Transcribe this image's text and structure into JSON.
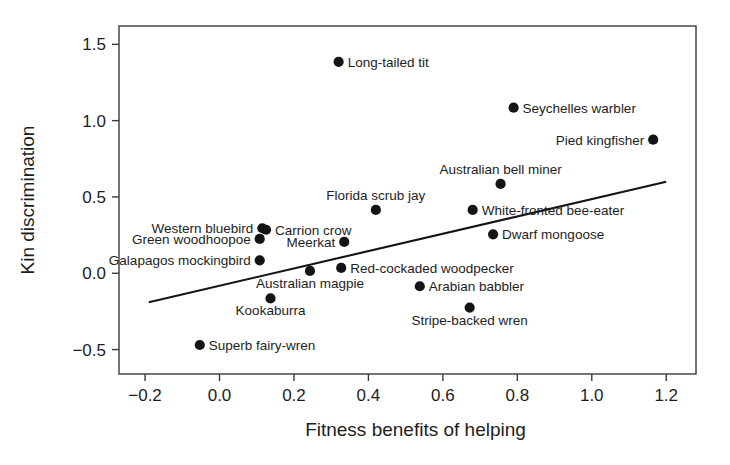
{
  "chart_data": {
    "type": "scatter",
    "title": "",
    "subtitle": "",
    "xlabel": "Fitness benefits of helping",
    "ylabel": "Kin discrimination",
    "xlim": [
      -0.27,
      1.28
    ],
    "ylim": [
      -0.66,
      1.62
    ],
    "xticks": [
      "-0.2",
      "0.0",
      "0.2",
      "0.4",
      "0.6",
      "0.8",
      "1.0",
      "1.2"
    ],
    "xtick_values": [
      -0.2,
      0.0,
      0.2,
      0.4,
      0.6,
      0.8,
      1.0,
      1.2
    ],
    "yticks": [
      "1.5",
      "1.0",
      "0.5",
      "0.0",
      "-0.5"
    ],
    "ytick_values": [
      1.5,
      1.0,
      0.5,
      0.0,
      -0.5
    ],
    "grid": false,
    "legend": false,
    "marker_color": "#141414",
    "line_color": "#141414",
    "axis_color": "#3a3a3a",
    "trendline": {
      "label": "regression-line",
      "x0": -0.19,
      "y0": -0.19,
      "x1": 1.2,
      "y1": 0.6
    },
    "points": [
      {
        "name": "Long-tailed tit",
        "x": 0.32,
        "y": 1.385,
        "label": "Long-tailed tit",
        "label_pos": "right"
      },
      {
        "name": "Seychelles warbler",
        "x": 0.79,
        "y": 1.085,
        "label": "Seychelles warbler",
        "label_pos": "right"
      },
      {
        "name": "Pied kingfisher",
        "x": 1.165,
        "y": 0.875,
        "label": "Pied kingfisher",
        "label_pos": "left"
      },
      {
        "name": "Australian bell miner",
        "x": 0.755,
        "y": 0.585,
        "label": "Australian bell miner",
        "label_pos": "above"
      },
      {
        "name": "Florida scrub jay",
        "x": 0.42,
        "y": 0.415,
        "label": "Florida scrub jay",
        "label_pos": "above"
      },
      {
        "name": "White-fronted bee-eater",
        "x": 0.68,
        "y": 0.415,
        "label": "White-fronted bee-eater",
        "label_pos": "right"
      },
      {
        "name": "Dwarf mongoose",
        "x": 0.735,
        "y": 0.255,
        "label": "Dwarf mongoose",
        "label_pos": "right"
      },
      {
        "name": "Western bluebird",
        "x": 0.115,
        "y": 0.295,
        "label": "Western bluebird",
        "label_pos": "left"
      },
      {
        "name": "Carrion crow",
        "x": 0.125,
        "y": 0.285,
        "label": "Carrion crow",
        "label_pos": "right"
      },
      {
        "name": "Green woodhoopoe",
        "x": 0.108,
        "y": 0.225,
        "label": "Green woodhoopoe",
        "label_pos": "left"
      },
      {
        "name": "Meerkat",
        "x": 0.335,
        "y": 0.205,
        "label": "Meerkat",
        "label_pos": "left"
      },
      {
        "name": "Galapagos mockingbird",
        "x": 0.108,
        "y": 0.085,
        "label": "Galapagos mockingbird",
        "label_pos": "left"
      },
      {
        "name": "Australian magpie",
        "x": 0.243,
        "y": 0.015,
        "label": "Australian magpie",
        "label_pos": "below"
      },
      {
        "name": "Red-cockaded woodpecker",
        "x": 0.327,
        "y": 0.035,
        "label": "Red-cockaded woodpecker",
        "label_pos": "right"
      },
      {
        "name": "Arabian babbler",
        "x": 0.538,
        "y": -0.085,
        "label": "Arabian babbler",
        "label_pos": "right"
      },
      {
        "name": "Kookaburra",
        "x": 0.137,
        "y": -0.165,
        "label": "Kookaburra",
        "label_pos": "below"
      },
      {
        "name": "Stripe-backed wren",
        "x": 0.672,
        "y": -0.225,
        "label": "Stripe-backed wren",
        "label_pos": "below"
      },
      {
        "name": "Superb fairy-wren",
        "x": -0.053,
        "y": -0.47,
        "label": "Superb fairy-wren",
        "label_pos": "right"
      }
    ]
  }
}
